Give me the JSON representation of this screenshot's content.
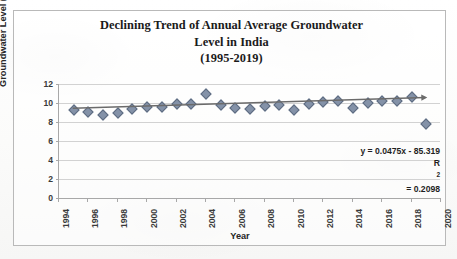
{
  "chart_data": {
    "type": "scatter",
    "title": "Declining Trend of Annual Average Groundwater Level in India (1995-2019)",
    "title_lines": [
      "Declining Trend of Annual Average Groundwater",
      "Level in India",
      "(1995-2019)"
    ],
    "xlabel": "Year",
    "ylabel": "Groundwater Level (mbgl)",
    "xlim": [
      1994,
      2020
    ],
    "ylim": [
      0,
      12
    ],
    "ytick_labels": [
      "0",
      "2",
      "4",
      "6",
      "8",
      "10",
      "12"
    ],
    "yticks": [
      0,
      2,
      4,
      6,
      8,
      10,
      12
    ],
    "xtick_labels": [
      "1994",
      "1996",
      "1998",
      "2000",
      "2002",
      "2004",
      "2006",
      "2008",
      "2010",
      "2012",
      "2014",
      "2016",
      "2018",
      "2020"
    ],
    "xticks": [
      1994,
      1996,
      1998,
      2000,
      2002,
      2004,
      2006,
      2008,
      2010,
      2012,
      2014,
      2016,
      2018,
      2020
    ],
    "grid": true,
    "legend": false,
    "x": [
      1995,
      1996,
      1997,
      1998,
      1999,
      2000,
      2001,
      2002,
      2003,
      2004,
      2005,
      2006,
      2007,
      2008,
      2009,
      2010,
      2011,
      2012,
      2013,
      2014,
      2015,
      2016,
      2017,
      2018,
      2019
    ],
    "values": [
      9.25,
      9.1,
      8.7,
      8.9,
      9.35,
      9.6,
      9.6,
      9.9,
      9.85,
      10.9,
      9.8,
      9.45,
      9.35,
      9.7,
      9.8,
      9.3,
      9.9,
      10.1,
      10.2,
      9.45,
      9.95,
      10.2,
      10.25,
      10.6,
      7.8
    ],
    "series": [
      {
        "name": "Annual average groundwater level",
        "marker": "diamond",
        "color": "#8492a8",
        "values": [
          9.25,
          9.1,
          8.7,
          8.9,
          9.35,
          9.6,
          9.6,
          9.9,
          9.85,
          10.9,
          9.8,
          9.45,
          9.35,
          9.7,
          9.8,
          9.3,
          9.9,
          10.1,
          10.2,
          9.45,
          9.95,
          10.2,
          10.25,
          10.6,
          7.8
        ]
      }
    ],
    "trendline": {
      "type": "linear",
      "equation": "y = 0.0475x - 85.319",
      "r_squared_label": "R",
      "r_squared_exponent": "2",
      "r_squared_value": " = 0.2098",
      "slope": 0.0475,
      "intercept": -85.319,
      "r_squared": 0.2098,
      "color": "#6b6b6b",
      "arrow_end": true,
      "x_start": 1995,
      "x_end": 2019
    },
    "annotations": [
      "y = 0.0475x - 85.319",
      "R² = 0.2098"
    ],
    "colors": {
      "marker": "#8492a8",
      "trendline": "#6b6b6b",
      "gridline": "#d2d2d2",
      "axis": "#a8a8a8",
      "frame": "#b9b9b9",
      "text": "#1a1a1a"
    }
  }
}
